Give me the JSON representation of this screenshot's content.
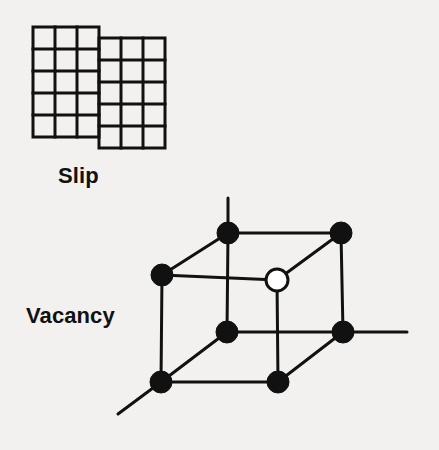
{
  "figure": {
    "background_color": "#f2f1ef",
    "ink_color": "#111111",
    "width": 439,
    "height": 450
  },
  "labels": {
    "slip": "Slip",
    "vacancy": "Vacancy"
  },
  "slip_diagram": {
    "description": "Two offset square lattice blocks illustrating a slip step",
    "grid_columns": 3,
    "grid_rows": 5,
    "cell_size": 22,
    "stroke_width": 3,
    "left_block": {
      "x": 33,
      "y": 27,
      "offset_y": 0
    },
    "right_block": {
      "x": 99,
      "y": 38,
      "offset_y": 11
    }
  },
  "vacancy_diagram": {
    "description": "Cubic unit cell with eight lattice sites; one site is empty (vacancy)",
    "stroke_width": 3,
    "atom_radius": 11,
    "vacancy_radius": 11,
    "atom_fill": "#111111",
    "vacancy_fill": "#ffffff",
    "vertices": [
      {
        "name": "top-back-left",
        "x": 228,
        "y": 233,
        "occupied": true
      },
      {
        "name": "top-back-right",
        "x": 341,
        "y": 233,
        "occupied": true
      },
      {
        "name": "top-front-left",
        "x": 162,
        "y": 275,
        "occupied": true
      },
      {
        "name": "top-front-right",
        "x": 277,
        "y": 280,
        "occupied": false
      },
      {
        "name": "bottom-back-left",
        "x": 227,
        "y": 332,
        "occupied": true
      },
      {
        "name": "bottom-back-right",
        "x": 343,
        "y": 332,
        "occupied": true
      },
      {
        "name": "bottom-front-left",
        "x": 161,
        "y": 382,
        "occupied": true
      },
      {
        "name": "bottom-front-right",
        "x": 278,
        "y": 382,
        "occupied": true
      }
    ],
    "axes": [
      {
        "name": "vertical-axis",
        "x1": 228,
        "y1": 233,
        "x2": 228,
        "y2": 198
      },
      {
        "name": "horizontal-axis",
        "x1": 343,
        "y1": 332,
        "x2": 407,
        "y2": 332
      },
      {
        "name": "diagonal-axis",
        "x1": 161,
        "y1": 382,
        "x2": 118,
        "y2": 414
      }
    ]
  }
}
